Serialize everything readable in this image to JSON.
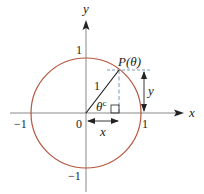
{
  "figure": {
    "type": "unit-circle",
    "axes": {
      "x_label": "x",
      "y_label": "y"
    },
    "ticks": {
      "origin": "0",
      "x_pos": "1",
      "x_neg": "−1",
      "y_pos": "1",
      "y_neg": "−1"
    },
    "point_label": "P(θ)",
    "radius_label": "1",
    "angle_label": "θ",
    "angle_superscript": "c",
    "horizontal_measure": "x",
    "vertical_measure": "y",
    "colors": {
      "circle": "#b5553f",
      "axes": "#888888",
      "radius": "#222222",
      "dashed": "#6b8fb0",
      "text": "#222222"
    }
  }
}
